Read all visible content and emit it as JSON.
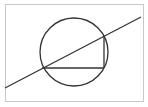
{
  "diagram": {
    "type": "geometry",
    "frame": {
      "x": 5,
      "y": 4,
      "width": 138,
      "height": 97,
      "stroke": "#c8c8c8"
    },
    "circle": {
      "cx": 74,
      "cy": 52,
      "r": 34,
      "stroke": "#333333"
    },
    "secant_line": {
      "x1": 5,
      "y1": 88,
      "x2": 141,
      "y2": 17,
      "stroke": "#333333"
    },
    "horizontal_chord": {
      "x1": 42,
      "y1": 68,
      "x2": 104,
      "y2": 68,
      "stroke": "#333333"
    },
    "vertical_chord": {
      "x1": 104,
      "y1": 36,
      "x2": 104,
      "y2": 68,
      "stroke": "#333333"
    },
    "colors": {
      "background": "#ffffff",
      "frame": "#c8c8c8",
      "ink": "#333333"
    }
  }
}
